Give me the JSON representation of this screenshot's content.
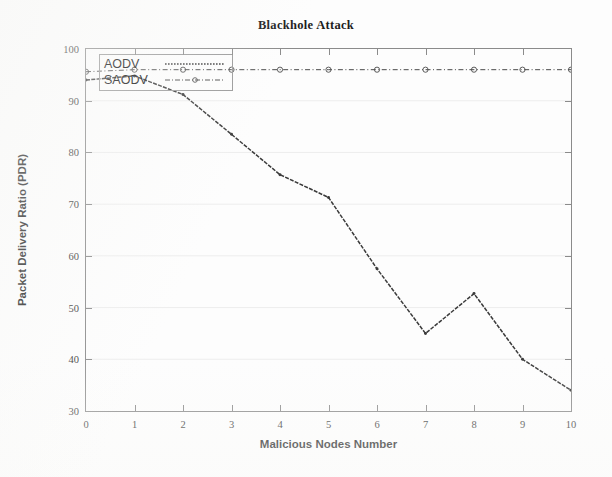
{
  "chart_data": {
    "type": "line",
    "title": "Blackhole Attack",
    "xlabel": "Malicious Nodes Number",
    "ylabel": "Packet Delivery Ratio (PDR)",
    "x": [
      0,
      1,
      2,
      3,
      4,
      5,
      6,
      7,
      8,
      9,
      10
    ],
    "xlim": [
      0,
      10
    ],
    "ylim": [
      30,
      100
    ],
    "xticks": [
      "0",
      "1",
      "2",
      "3",
      "4",
      "5",
      "6",
      "7",
      "8",
      "9",
      "10"
    ],
    "yticks": [
      "30",
      "40",
      "50",
      "60",
      "70",
      "80",
      "90",
      "100"
    ],
    "grid": "horizontal-faint",
    "legend_position": "top-left-inside",
    "series": [
      {
        "name": "AODV",
        "style": "dashed-with-dots",
        "color": "#3b3b3b",
        "values": [
          94.0,
          94.8,
          91.2,
          83.5,
          75.7,
          71.3,
          57.5,
          45.0,
          52.7,
          40.0,
          34.0
        ]
      },
      {
        "name": "SAODV",
        "style": "dash-dot-with-circles",
        "color": "#4a4a4a",
        "values": [
          95.6,
          96.0,
          96.0,
          96.0,
          96.0,
          96.0,
          96.0,
          96.0,
          96.0,
          96.0,
          96.0
        ]
      }
    ]
  },
  "legend": {
    "items": [
      {
        "label": "AODV"
      },
      {
        "label": "SAODV"
      }
    ]
  }
}
